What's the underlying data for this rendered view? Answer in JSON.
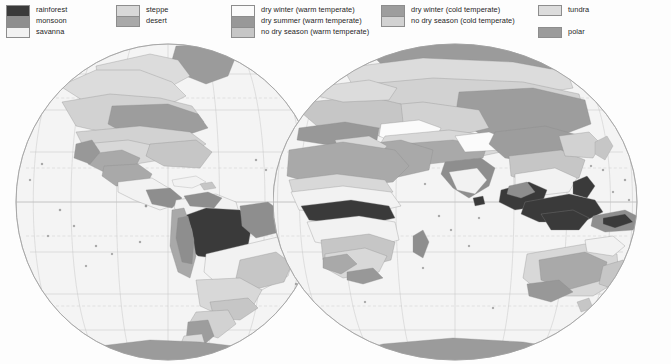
{
  "legend": {
    "groups": [
      {
        "name": "tropical",
        "x": 6,
        "y": 5,
        "items": [
          {
            "label": "rainforest",
            "color": "#3a3a3a"
          },
          {
            "label": "monsoon",
            "color": "#8e8e8e"
          },
          {
            "label": "savanna",
            "color": "#f2f2f2"
          }
        ]
      },
      {
        "name": "arid",
        "x": 116,
        "y": 5,
        "items": [
          {
            "label": "steppe",
            "color": "#d8d8d8"
          },
          {
            "label": "desert",
            "color": "#a9a9a9"
          }
        ]
      },
      {
        "name": "warm-temperate",
        "x": 231,
        "y": 5,
        "items": [
          {
            "label": "dry winter (warm temperate)",
            "color": "#fbfbfb"
          },
          {
            "label": "dry summer (warm temperate)",
            "color": "#989898"
          },
          {
            "label": "no dry season (warm temperate)",
            "color": "#c6c6c6"
          }
        ]
      },
      {
        "name": "cold-temperate",
        "x": 381,
        "y": 5,
        "items": [
          {
            "label": "dry winter (cold temperate)",
            "color": "#9d9d9d"
          },
          {
            "label": "no dry season (cold temperate)",
            "color": "#d2d2d2"
          }
        ]
      },
      {
        "name": "polar-group",
        "x": 538,
        "y": 5,
        "items": [
          {
            "label": "tundra",
            "color": "#dcdcdc"
          }
        ]
      },
      {
        "name": "polar-group-2",
        "x": 538,
        "y": 27,
        "items": [
          {
            "label": "polar",
            "color": "#9b9b9b"
          }
        ]
      }
    ]
  },
  "map": {
    "projection": "two-hemisphere globes",
    "hemispheres": [
      {
        "name": "western-hemisphere",
        "continents": "Americas",
        "cx": 168,
        "cy": 162,
        "rx": 152,
        "ry": 158
      },
      {
        "name": "eastern-hemisphere",
        "continents": "Africa, Eurasia, Australia",
        "cx": 455,
        "cy": 162,
        "rx": 182,
        "ry": 158
      }
    ],
    "graticule": {
      "parallels": 9,
      "meridians": 9,
      "tropics_dashed": true
    },
    "colors": {
      "ocean": "#f4f4f4",
      "outline": "#b4b4b4",
      "graticule": "#c3c3c3",
      "coast": "#7e7e7e",
      "rainforest": "#3a3a3a",
      "monsoon": "#8e8e8e",
      "savanna": "#f2f2f2",
      "steppe": "#d8d8d8",
      "desert": "#a9a9a9",
      "dry_winter_warm": "#fbfbfb",
      "dry_summer_warm": "#989898",
      "no_dry_warm": "#c6c6c6",
      "dry_winter_cold": "#9d9d9d",
      "no_dry_cold": "#d2d2d2",
      "tundra": "#dcdcdc",
      "polar": "#9b9b9b"
    }
  }
}
